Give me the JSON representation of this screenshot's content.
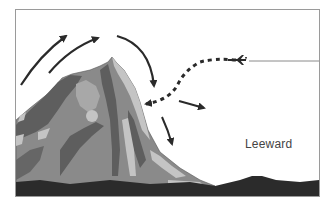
{
  "diagram": {
    "labels": {
      "leeward": "Leeward"
    },
    "elements": [
      {
        "type": "mountain",
        "position": "left-center"
      },
      {
        "type": "ground",
        "position": "bottom"
      },
      {
        "type": "arrow",
        "style": "solid",
        "description": "upslope wind, windward side, outer"
      },
      {
        "type": "arrow",
        "style": "solid",
        "description": "upslope wind, windward side, inner"
      },
      {
        "type": "arrow",
        "style": "solid",
        "description": "downdraft over summit toward leeward slope"
      },
      {
        "type": "arrow",
        "style": "solid",
        "description": "eddy outward from leeward slope"
      },
      {
        "type": "arrow",
        "style": "solid",
        "description": "downdraft along leeward slope"
      },
      {
        "type": "arrow",
        "style": "dashed",
        "description": "aircraft flight path descending toward leeward slope"
      },
      {
        "type": "aircraft",
        "position": "upper right",
        "icon": "airplane-icon"
      },
      {
        "type": "line",
        "description": "horizontal reference line from aircraft to right edge"
      }
    ],
    "colors": {
      "arrow": "#2a2a2a",
      "ground": "#2b2b2b",
      "mountain_dark": "#5e5e5e",
      "mountain_mid": "#8a8a8a",
      "mountain_light": "#c4c4c4",
      "frame": "#9a9a9a",
      "label": "#444444"
    }
  }
}
